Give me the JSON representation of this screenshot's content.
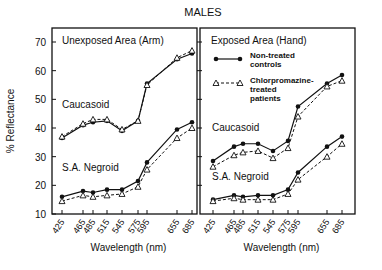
{
  "figure": {
    "title": "MALES",
    "ylabel": "% Reflectance",
    "xlabel": "Wavelength (nm)"
  },
  "legend": {
    "items": [
      {
        "label_line1": "Non-treated",
        "label_line2": "controls",
        "label_line3": "",
        "marker": "filled-circle",
        "line": "solid"
      },
      {
        "label_line1": "Chlorpromazine-",
        "label_line2": "treated",
        "label_line3": "patients",
        "marker": "open-triangle",
        "line": "dashed"
      }
    ]
  },
  "chart_data": [
    {
      "type": "line",
      "title": "Unexposed Area (Arm)",
      "xlabel": "Wavelength (nm)",
      "ylabel": "% Reflectance",
      "x": [
        425,
        465,
        485,
        515,
        545,
        575,
        595,
        655,
        685
      ],
      "x_tick_labels": [
        "425",
        "465",
        "485",
        "515",
        "545",
        "575",
        "595",
        "655",
        "685"
      ],
      "y_ticks": [
        10,
        20,
        30,
        40,
        50,
        60,
        70
      ],
      "ylim": [
        10,
        75
      ],
      "grid": false,
      "group_labels": [
        "Caucasoid",
        "S.A. Negroid"
      ],
      "series": [
        {
          "name": "Caucasoid - Non-treated controls",
          "marker": "filled-circle",
          "values": [
            36.5,
            41,
            42,
            42.5,
            39,
            42.5,
            55.5,
            64,
            66
          ]
        },
        {
          "name": "Caucasoid - Chlorpromazine-treated patients",
          "marker": "open-triangle",
          "values": [
            37,
            41.5,
            43,
            43,
            39.5,
            42.5,
            55,
            64.5,
            67
          ]
        },
        {
          "name": "S.A. Negroid - Non-treated controls",
          "marker": "filled-circle",
          "values": [
            16,
            18,
            17.5,
            18.5,
            18.5,
            21.5,
            28,
            39.5,
            42
          ]
        },
        {
          "name": "S.A. Negroid - Chlorpromazine-treated patients",
          "marker": "open-triangle",
          "values": [
            14.5,
            16.5,
            16,
            16.5,
            17,
            19.5,
            25.5,
            36.5,
            40
          ]
        }
      ]
    },
    {
      "type": "line",
      "title": "Exposed Area (Hand)",
      "xlabel": "Wavelength (nm)",
      "ylabel": "% Reflectance",
      "x": [
        425,
        465,
        485,
        515,
        545,
        575,
        595,
        655,
        685
      ],
      "x_tick_labels": [
        "425",
        "465",
        "485",
        "515",
        "545",
        "575",
        "595",
        "655",
        "685"
      ],
      "y_ticks": [
        10,
        20,
        30,
        40,
        50,
        60,
        70
      ],
      "ylim": [
        10,
        75
      ],
      "grid": false,
      "legend_position": "upper-left",
      "group_labels": [
        "Caucasoid",
        "S.A. Negroid"
      ],
      "series": [
        {
          "name": "Caucasoid - Non-treated controls",
          "marker": "filled-circle",
          "values": [
            28.5,
            33.5,
            34.5,
            34.5,
            32,
            35.5,
            47.5,
            55.5,
            58.5
          ]
        },
        {
          "name": "Caucasoid - Chlorpromazine-treated patients",
          "marker": "open-triangle",
          "values": [
            26.5,
            30.5,
            31.5,
            32,
            29.5,
            33,
            44,
            54.5,
            56.5
          ]
        },
        {
          "name": "S.A. Negroid - Non-treated controls",
          "marker": "filled-circle",
          "values": [
            15,
            16.5,
            16,
            16.5,
            16.5,
            18.5,
            24.5,
            33.5,
            37
          ]
        },
        {
          "name": "S.A. Negroid - Chlorpromazine-treated patients",
          "marker": "open-triangle",
          "values": [
            14.5,
            15.5,
            15,
            15,
            15,
            17,
            22,
            30,
            34.5
          ]
        }
      ]
    }
  ]
}
